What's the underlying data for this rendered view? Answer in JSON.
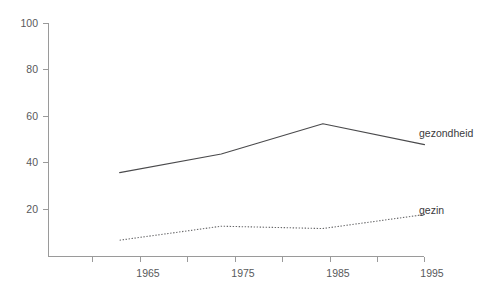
{
  "chart_data": {
    "type": "line",
    "title": "",
    "subtitle": "",
    "xlabel": "",
    "ylabel": "",
    "xlim": [
      1958,
      1995
    ],
    "ylim": [
      0,
      100
    ],
    "grid": false,
    "legend_position": "inline-right-end-of-line",
    "x": [
      1965,
      1975,
      1985,
      1995
    ],
    "x_tick_labels": [
      "1965",
      "1975",
      "1985",
      "1995"
    ],
    "x_minor_ticks": [
      1960,
      1970,
      1980,
      1990
    ],
    "y_tick_labels": [
      "20",
      "40",
      "60",
      "80",
      "100"
    ],
    "y_ticks": [
      20,
      40,
      60,
      80,
      100
    ],
    "series": [
      {
        "name": "gezondheid",
        "style": "solid",
        "color": "#4a4a4c",
        "values": [
          36,
          44,
          57,
          48
        ]
      },
      {
        "name": "gezin",
        "style": "dotted",
        "color": "#6a6a6c",
        "values": [
          7,
          13,
          12,
          18
        ]
      }
    ],
    "annotations": [
      {
        "text": "gezondheid",
        "series": "gezondheid"
      },
      {
        "text": "gezin",
        "series": "gezin"
      }
    ]
  },
  "axis": {
    "y_labels": {
      "t100": "100",
      "t80": "80",
      "t60": "60",
      "t40": "40",
      "t20": "20"
    },
    "x_labels": {
      "t1965": "1965",
      "t1975": "1975",
      "t1985": "1985",
      "t1995": "1995"
    }
  },
  "labels": {
    "gezondheid": "gezondheid",
    "gezin": "gezin"
  },
  "colors": {
    "background": "#ffffff",
    "axis": "#9a9a9a",
    "text": "#58595b",
    "series_gezondheid": "#4a4a4c",
    "series_gezin": "#6a6a6c"
  }
}
